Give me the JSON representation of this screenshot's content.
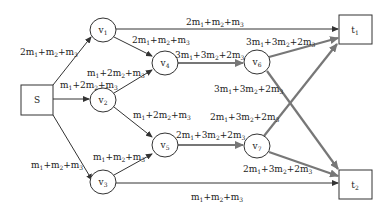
{
  "diagram": {
    "type": "flow-network",
    "colors": {
      "thin_edge": "#333333",
      "thick_edge": "#777777",
      "node_stroke": "#333333",
      "text": "#222222"
    },
    "nodes": [
      {
        "id": "S",
        "label": "S",
        "shape": "box",
        "x": 37,
        "y": 100
      },
      {
        "id": "v1",
        "label": "v",
        "sub": "1",
        "shape": "ellipse",
        "x": 103,
        "y": 30
      },
      {
        "id": "v2",
        "label": "v",
        "sub": "2",
        "shape": "ellipse",
        "x": 103,
        "y": 100
      },
      {
        "id": "v3",
        "label": "v",
        "sub": "3",
        "shape": "ellipse",
        "x": 103,
        "y": 182
      },
      {
        "id": "v4",
        "label": "v",
        "sub": "4",
        "shape": "ellipse",
        "x": 165,
        "y": 63
      },
      {
        "id": "v5",
        "label": "v",
        "sub": "5",
        "shape": "ellipse",
        "x": 165,
        "y": 145
      },
      {
        "id": "v6",
        "label": "v",
        "sub": "6",
        "shape": "ellipse",
        "x": 257,
        "y": 62
      },
      {
        "id": "v7",
        "label": "v",
        "sub": "7",
        "shape": "ellipse",
        "x": 257,
        "y": 146
      },
      {
        "id": "t1",
        "label": "t",
        "sub": "1",
        "shape": "box",
        "x": 355,
        "y": 30
      },
      {
        "id": "t2",
        "label": "t",
        "sub": "2",
        "shape": "box",
        "x": 355,
        "y": 185
      }
    ],
    "edges": [
      {
        "from": "S",
        "to": "v1",
        "label": "2m1+m2+m3",
        "style": "thin"
      },
      {
        "from": "S",
        "to": "v2",
        "label": "m1+2m2+m3",
        "style": "thin"
      },
      {
        "from": "S",
        "to": "v3",
        "label": "m1+m2+m3",
        "style": "thin"
      },
      {
        "from": "v1",
        "to": "t1",
        "label": "2m1+m2+m3",
        "style": "thin"
      },
      {
        "from": "v1",
        "to": "v4",
        "label": "2m1+m2+m3",
        "style": "thin"
      },
      {
        "from": "v2",
        "to": "v4",
        "label": "m1+2m2+m3",
        "style": "thin"
      },
      {
        "from": "v2",
        "to": "v5",
        "label": "m1+2m2+m3",
        "style": "thin"
      },
      {
        "from": "v3",
        "to": "v5",
        "label": "m1+m2+m3",
        "style": "thin"
      },
      {
        "from": "v3",
        "to": "t2",
        "label": "m1+m2+m3",
        "style": "thin"
      },
      {
        "from": "v4",
        "to": "v6",
        "label": "3m1+3m2+2m3",
        "style": "thick"
      },
      {
        "from": "v5",
        "to": "v7",
        "label": "2m1+3m2+2m3",
        "style": "thick"
      },
      {
        "from": "v6",
        "to": "t1",
        "label": "3m1+3m2+2m3",
        "style": "thick"
      },
      {
        "from": "v6",
        "to": "t2",
        "label": "3m1+3m2+2m3",
        "style": "thick"
      },
      {
        "from": "v7",
        "to": "t1",
        "label": "2m1+3m2+2m3",
        "style": "thick"
      },
      {
        "from": "v7",
        "to": "t2",
        "label": "2m1+3m2+2m3",
        "style": "thick"
      }
    ]
  }
}
